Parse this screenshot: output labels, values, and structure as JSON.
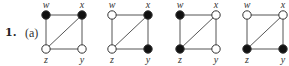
{
  "exercise": {
    "number": "1.",
    "part": "(a)"
  },
  "colors": {
    "edge": "#555555",
    "filled_vertex": "#111111",
    "empty_vertex": "#ffffff",
    "vertex_stroke": "#333333"
  },
  "edges": [
    [
      "w",
      "x"
    ],
    [
      "x",
      "y"
    ],
    [
      "y",
      "z"
    ],
    [
      "z",
      "w"
    ],
    [
      "z",
      "x"
    ]
  ],
  "graphs": [
    {
      "origin_x": 46,
      "vertices": {
        "w": "filled",
        "x": "filled",
        "z": "empty",
        "y": "empty"
      }
    },
    {
      "origin_x": 112,
      "vertices": {
        "w": "empty",
        "x": "filled",
        "z": "empty",
        "y": "filled"
      }
    },
    {
      "origin_x": 180,
      "vertices": {
        "w": "filled",
        "x": "empty",
        "z": "filled",
        "y": "empty"
      }
    },
    {
      "origin_x": 247,
      "vertices": {
        "w": "empty",
        "x": "empty",
        "z": "filled",
        "y": "filled"
      }
    }
  ],
  "vertex_labels": {
    "w": "w",
    "x": "x",
    "y": "y",
    "z": "z"
  }
}
